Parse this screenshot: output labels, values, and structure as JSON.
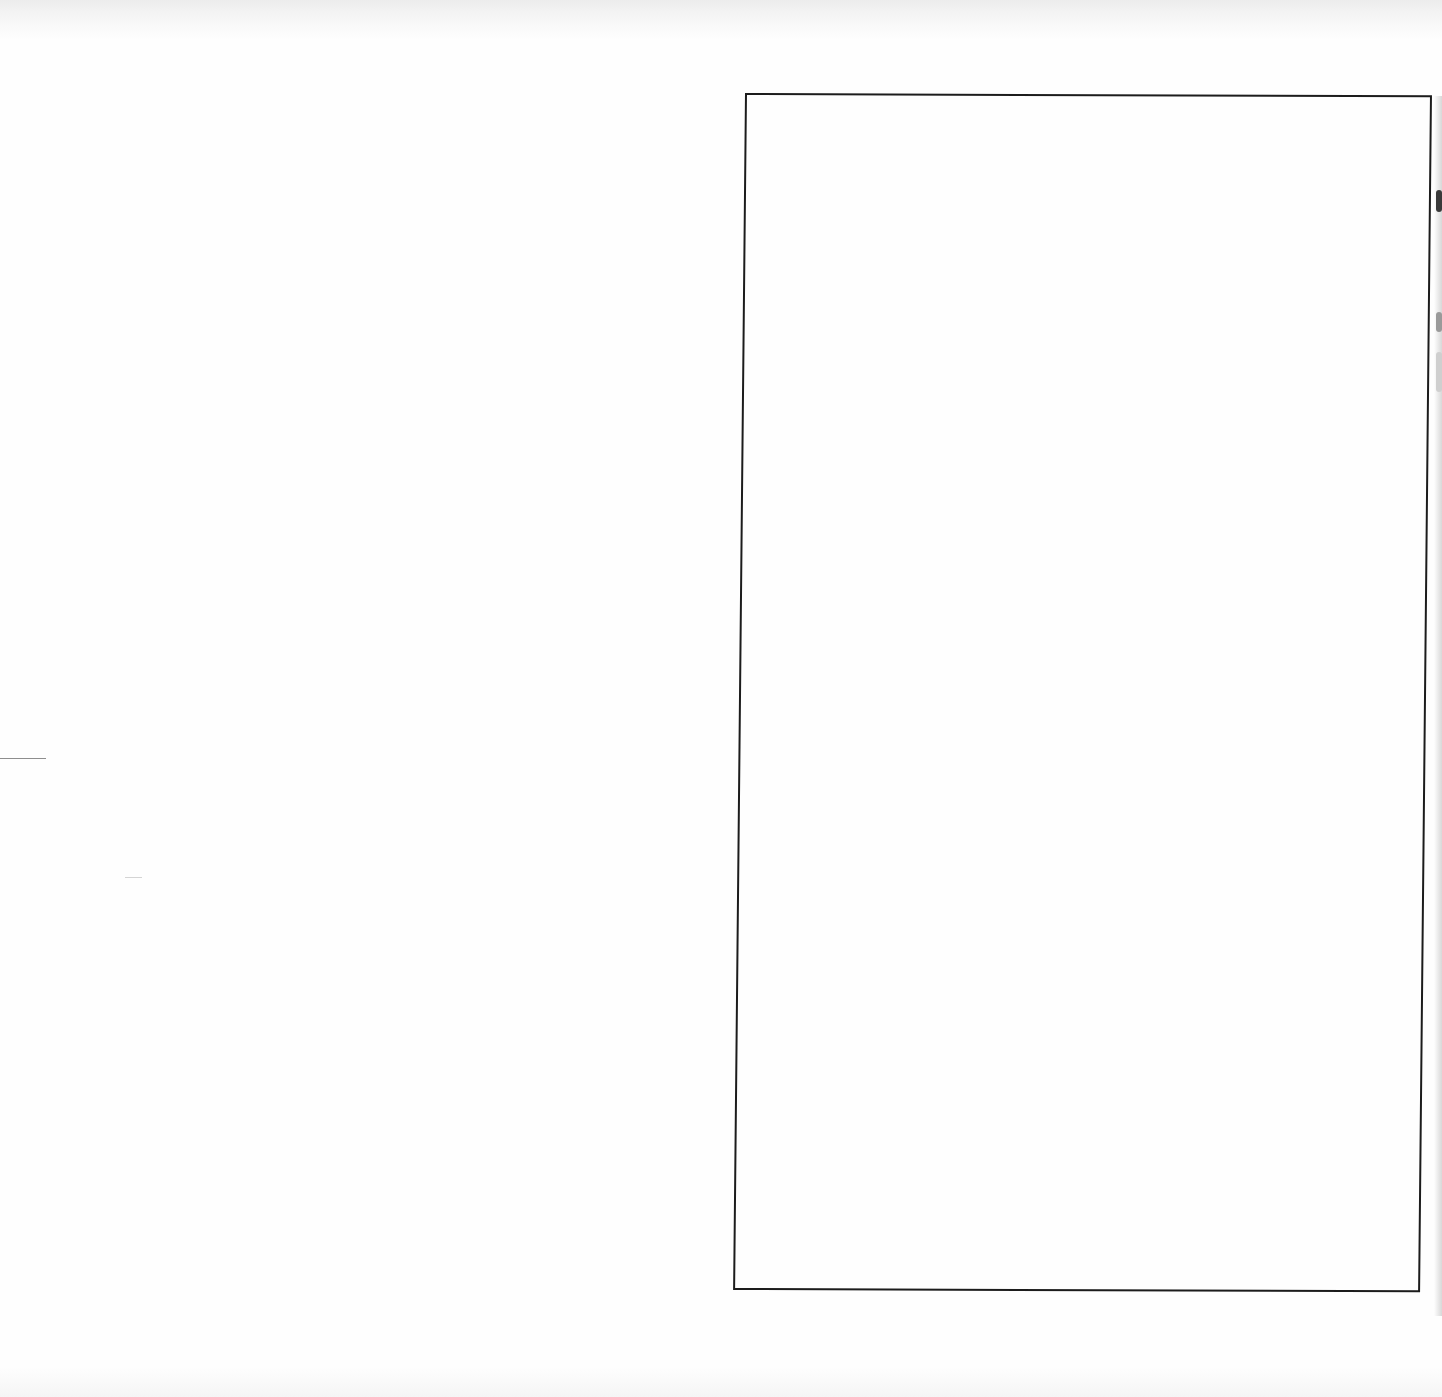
{
  "document": {
    "type": "scanned page",
    "text_content": "",
    "frame": {
      "description": "empty rectangular bordered box",
      "border_color": "#1c1c1c",
      "content": ""
    },
    "marks": {
      "left_rule": "short horizontal rule",
      "faint_tick": "faint horizontal tick"
    },
    "colors": {
      "paper": "#fefefe",
      "ink": "#1c1c1c",
      "scan_noise": "#ececec"
    }
  }
}
